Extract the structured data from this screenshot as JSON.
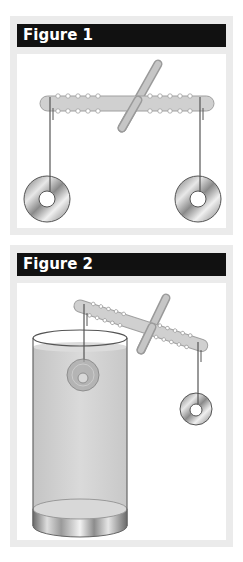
{
  "figures": [
    {
      "title": "Figure 1",
      "description": "Balance with a horizontal notched rod pivoting on a diagonal stick; two equal metal washers hang from each end, rod level."
    },
    {
      "title": "Figure 2",
      "description": "Same balance; left washer submerged in a beaker of water, rod tilted up on the left; right washer hangs in air."
    }
  ],
  "colors": {
    "header_bg": "#111111",
    "header_text": "#ffffff",
    "panel_border": "#ebebeb",
    "rod": "#cfcfcf",
    "water": "#d4d4d4",
    "washer": "#a8a8a8"
  }
}
